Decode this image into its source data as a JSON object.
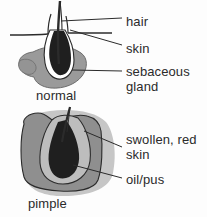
{
  "figure": {
    "background_color": "#fdfdfd",
    "ink_color": "#2b2b2b"
  },
  "palette": {
    "outline": "#2b2b2b",
    "gland_gray": "#9a9a9a",
    "skin_gray": "#8f8f8f",
    "inner_gray": "#b9b9b9",
    "shadow_gray": "#c3c3c3",
    "bulb_dark": "#1f1f1f",
    "duct_white": "#ffffff"
  },
  "diagrams": [
    {
      "id": "normal-follicle",
      "caption": "normal",
      "parts": [
        "hair-shaft",
        "skin-surface",
        "sebaceous-gland",
        "hair-bulb",
        "follicle-duct"
      ]
    },
    {
      "id": "pimple-follicle",
      "caption": "pimple",
      "parts": [
        "hair-shaft",
        "swollen-skin",
        "inflamed-tissue",
        "oil-pus-bulb"
      ]
    }
  ],
  "labels": [
    {
      "id": "hair",
      "text": "hair"
    },
    {
      "id": "skin",
      "text": "skin"
    },
    {
      "id": "sebaceous",
      "text": "sebaceous\ngland"
    },
    {
      "id": "swollen",
      "text": "swollen, red\nskin"
    },
    {
      "id": "oilpus",
      "text": "oil/pus"
    }
  ],
  "captions": [
    {
      "id": "normal",
      "text": "normal"
    },
    {
      "id": "pimple",
      "text": "pimple"
    }
  ]
}
